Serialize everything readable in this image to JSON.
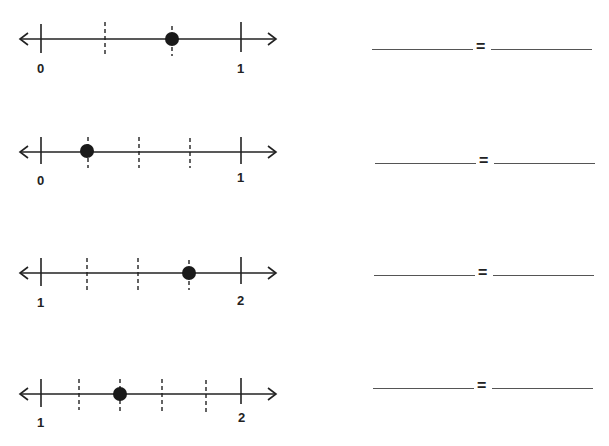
{
  "worksheet": {
    "problems": [
      {
        "id": 1,
        "start_label": "0",
        "end_label": "1",
        "divisions": 3,
        "point_at_division": 2,
        "answer_left": "",
        "answer_right": "",
        "equals": "="
      },
      {
        "id": 2,
        "start_label": "0",
        "end_label": "1",
        "divisions": 4,
        "point_at_division": 1,
        "answer_left": "",
        "answer_right": "",
        "equals": "="
      },
      {
        "id": 3,
        "start_label": "1",
        "end_label": "2",
        "divisions": 4,
        "point_at_division": 3,
        "answer_left": "",
        "answer_right": "",
        "equals": "="
      },
      {
        "id": 4,
        "start_label": "1",
        "end_label": "2",
        "divisions": 5,
        "point_at_division": 2,
        "answer_left": "",
        "answer_right": "",
        "equals": "="
      }
    ]
  },
  "colors": {
    "line": "#222222",
    "point": "#1a1a1a",
    "blank": "#555555"
  }
}
